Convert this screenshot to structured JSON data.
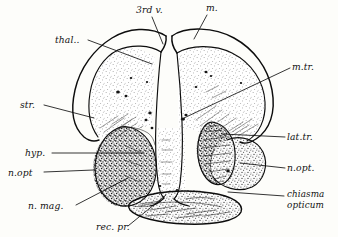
{
  "figure": {
    "background_color": "#fdfdfa",
    "ink_color": "#111111",
    "style": "stippled pen-and-ink histological section drawing"
  },
  "labels": [
    {
      "id": "third-ventricle",
      "text": "3rd v.",
      "x": 136,
      "y": 13,
      "anchor": "start",
      "lines": 1
    },
    {
      "id": "m",
      "text": "m.",
      "x": 206,
      "y": 11,
      "anchor": "start",
      "lines": 1
    },
    {
      "id": "thalamus",
      "text": "thal..",
      "x": 55,
      "y": 43,
      "anchor": "start",
      "lines": 1
    },
    {
      "id": "m-tr",
      "text": "m.tr.",
      "x": 292,
      "y": 70,
      "anchor": "start",
      "lines": 1
    },
    {
      "id": "striatum",
      "text": "str.",
      "x": 20,
      "y": 108,
      "anchor": "start",
      "lines": 1
    },
    {
      "id": "lat-tr",
      "text": "lat.tr.",
      "x": 287,
      "y": 140,
      "anchor": "start",
      "lines": 1
    },
    {
      "id": "hypothalamus",
      "text": "hyp.",
      "x": 25,
      "y": 156,
      "anchor": "start",
      "lines": 1
    },
    {
      "id": "n-opt-right",
      "text": "n.opt.",
      "x": 287,
      "y": 171,
      "anchor": "start",
      "lines": 1
    },
    {
      "id": "n-opt-left",
      "text": "n.opt",
      "x": 8,
      "y": 176,
      "anchor": "start",
      "lines": 1
    },
    {
      "id": "n-mag",
      "text": "n. mag.",
      "x": 28,
      "y": 209,
      "anchor": "start",
      "lines": 1
    },
    {
      "id": "rec-pr",
      "text": "rec. pr.",
      "x": 96,
      "y": 230,
      "anchor": "start",
      "lines": 1
    }
  ],
  "multiline_labels": [
    {
      "id": "chiasma-opticum",
      "line1": "chiasma",
      "line2": "opticum",
      "x": 287,
      "y": 197
    }
  ],
  "structures": [
    {
      "id": "left-hemisphere",
      "name": "left hemisphere (thalamus / striatum)",
      "shading": "light stipple"
    },
    {
      "id": "right-hemisphere",
      "name": "right hemisphere (thalamus / striatum)",
      "shading": "light stipple"
    },
    {
      "id": "third-ventricle-cleft",
      "name": "third ventricle midline cleft",
      "shading": "unshaded white channel"
    },
    {
      "id": "left-hypothalamic-mass",
      "name": "n. magnocellularis / hypothalamus",
      "shading": "dark dense stipple"
    },
    {
      "id": "right-lateral-tract",
      "name": "lateral tract fiber bundle",
      "shading": "dark streaked fibers"
    },
    {
      "id": "right-optic-lobe",
      "name": "optic nerve lobe",
      "shading": "medium stipple"
    },
    {
      "id": "optic-chiasm",
      "name": "chiasma opticum",
      "shading": "banded dark fibers"
    },
    {
      "id": "pial-membrane",
      "name": "outer pial membrane double outline",
      "shading": "line only"
    }
  ]
}
